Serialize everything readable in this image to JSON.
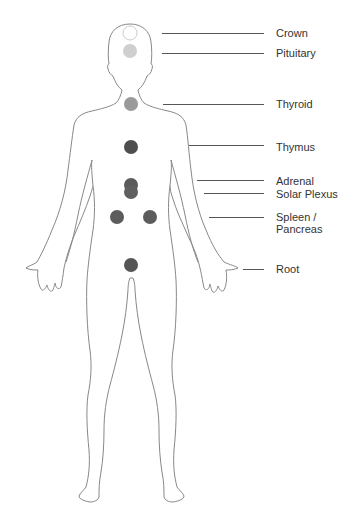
{
  "diagram": {
    "title": "",
    "body_outline_color": "#888888",
    "chakras": [
      {
        "name": "Crown",
        "cx": 130,
        "cy": 33,
        "r": 7,
        "fill": "#ffffff",
        "stroke": "#cccccc",
        "label_x": 276,
        "label_y": 27,
        "line_x1": 162,
        "line_x2": 264,
        "line_y": 33
      },
      {
        "name": "Pituitary",
        "cx": 130,
        "cy": 51,
        "r": 7,
        "fill": "#cfcfcf",
        "stroke": "none",
        "label_x": 276,
        "label_y": 47,
        "line_x1": 162,
        "line_x2": 264,
        "line_y": 53
      },
      {
        "name": "Thyroid",
        "cx": 131,
        "cy": 104,
        "r": 7,
        "fill": "#9a9a9a",
        "stroke": "none",
        "label_x": 276,
        "label_y": 97,
        "line_x1": 163,
        "line_x2": 264,
        "line_y": 104
      },
      {
        "name": "Thymus",
        "cx": 131,
        "cy": 147,
        "r": 7,
        "fill": "#4e4e4e",
        "stroke": "none",
        "label_x": 276,
        "label_y": 141,
        "line_x1": 189,
        "line_x2": 264,
        "line_y": 145
      },
      {
        "name": "Adrenal",
        "cx": 131,
        "cy": 185,
        "r": 7,
        "fill": "#5a5a5a",
        "stroke": "none",
        "label_x": 276,
        "label_y": 175,
        "line_x1": 197,
        "line_x2": 264,
        "line_y": 180
      },
      {
        "name": "Solar Plexus",
        "cx": 131,
        "cy": 193,
        "r": 7,
        "fill": "#5f5f5f",
        "stroke": "none",
        "label_x": 276,
        "label_y": 188,
        "line_x1": 204,
        "line_x2": 264,
        "line_y": 193
      },
      {
        "name": "Spleen / Pancreas",
        "cx": 117,
        "cy": 217,
        "r": 7,
        "fill": "#5c5c5c",
        "stroke": "none",
        "label_x": 276,
        "label_y": 211,
        "line_x1": 209,
        "line_x2": 264,
        "line_y": 217
      },
      {
        "name": "Spleen (right)",
        "cx": 150,
        "cy": 217,
        "r": 7,
        "fill": "#5c5c5c",
        "stroke": "none",
        "label_x": null,
        "label_y": null,
        "line_x1": null,
        "line_x2": null,
        "line_y": null
      },
      {
        "name": "Root",
        "cx": 131,
        "cy": 265,
        "r": 7,
        "fill": "#555555",
        "stroke": "none",
        "label_x": 276,
        "label_y": 263,
        "line_x1": 243,
        "line_x2": 264,
        "line_y": 269
      }
    ],
    "labels": {
      "crown": "Crown",
      "pituitary": "Pituitary",
      "thyroid": "Thyroid",
      "thymus": "Thymus",
      "adrenal": "Adrenal",
      "solar_plexus": "Solar Plexus",
      "spleen_line1": "Spleen /",
      "spleen_line2": "Pancreas",
      "root": "Root"
    }
  }
}
